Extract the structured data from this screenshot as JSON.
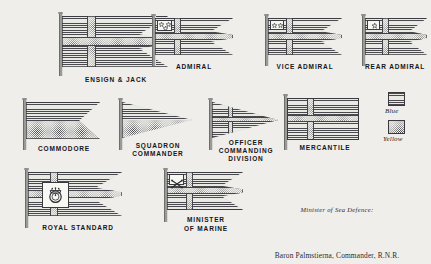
{
  "plate": {
    "background_color": "#efeeea",
    "ink_color": "#2e2e33"
  },
  "flags": [
    {
      "id": "ensign-jack",
      "label": "ENSIGN & JACK",
      "shape": "triple-tail-swallowtail",
      "description": "Swedish blue field with yellow Scandinavian cross, three-tongued"
    },
    {
      "id": "admiral",
      "label": "ADMIRAL",
      "shape": "triple-tail-swallowtail",
      "stars": 3,
      "description": "Ensign with three stars in upper hoist canton"
    },
    {
      "id": "vice-admiral",
      "label": "VICE ADMIRAL",
      "shape": "triple-tail-swallowtail",
      "stars": 2,
      "description": "Ensign with two stars in upper hoist canton"
    },
    {
      "id": "rear-admiral",
      "label": "REAR ADMIRAL",
      "shape": "triple-tail-swallowtail",
      "stars": 1,
      "description": "Ensign with one star in upper hoist canton"
    },
    {
      "id": "commodore",
      "label": "COMMODORE",
      "shape": "swallowtail",
      "description": "Blue over yellow horizontal bicolour, swallowtailed"
    },
    {
      "id": "squadron-commander",
      "label": "SQUADRON\nCOMMANDER",
      "shape": "pennant",
      "description": "Tapering pennant, blue over yellow"
    },
    {
      "id": "officer-commanding-division",
      "label": "OFFICER\nCOMMANDING\nDIVISION",
      "shape": "pennant-cross",
      "description": "Tapering pennant with yellow cross near hoist"
    },
    {
      "id": "mercantile",
      "label": "MERCANTILE",
      "shape": "rectangle",
      "description": "Plain rectangular blue flag with yellow cross"
    },
    {
      "id": "royal-standard",
      "label": "ROYAL STANDARD",
      "shape": "triple-tail-swallowtail",
      "emblem": "royal-arms-roundel",
      "description": "Ensign charged with the royal arms on a white square at the cross centre"
    },
    {
      "id": "minister-of-marine",
      "label": "MINISTER\nOF MARINE",
      "shape": "triple-tail-swallowtail",
      "canton_charge": "crossed-batons",
      "description": "Ensign with crossed batons in the upper hoist canton"
    }
  ],
  "legend": {
    "items": [
      {
        "label": "Blue",
        "pattern": "horizontal-hatching"
      },
      {
        "label": "Yellow",
        "pattern": "stipple-dots"
      }
    ]
  },
  "signature": {
    "title": "Minister of Sea Defence:",
    "name": "Baron Palmstierna, Commander, R.N.R."
  }
}
